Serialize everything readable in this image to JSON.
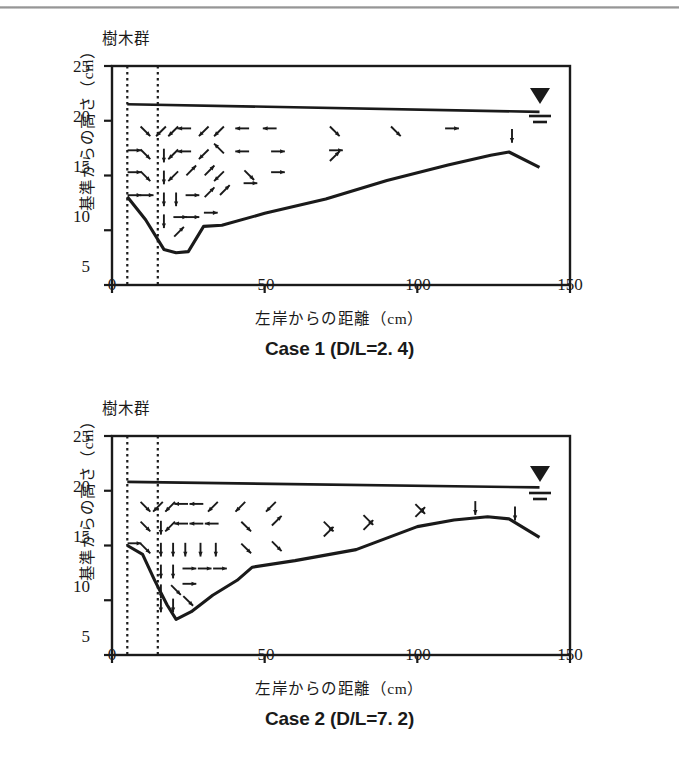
{
  "page": {
    "top_rule": "scan-edge-rule"
  },
  "axes": {
    "y_label": "基準からの高さ（cm）",
    "x_label": "左岸からの距離（cm）",
    "y_ticks": [
      25,
      20,
      15,
      10,
      5
    ],
    "x_ticks": [
      0,
      50,
      100,
      150
    ],
    "y_range": [
      5,
      25
    ],
    "x_range": [
      0,
      150
    ],
    "y_unit": "cm",
    "x_unit": "cm"
  },
  "annotations": {
    "vegetation_label": "樹木群",
    "vegetation_band_cm": [
      5,
      15
    ],
    "water_surface_symbol": "inverted-triangle-with-hatch"
  },
  "chart_data": [
    {
      "type": "line",
      "title": "Case 1（D/L=2.4）",
      "caption": "Case 1 (D/L=2. 4)",
      "xlabel": "左岸からの距離（cm）",
      "ylabel": "基準からの高さ（cm）",
      "xlim": [
        0,
        150
      ],
      "ylim": [
        5,
        25
      ],
      "grid": false,
      "legend": "none",
      "series": [
        {
          "name": "水面 (water surface)",
          "x": [
            5,
            140
          ],
          "values": [
            21.6,
            20.9
          ]
        },
        {
          "name": "河床 (bed profile)",
          "x": [
            5,
            11,
            17,
            21,
            25,
            30,
            36,
            50,
            70,
            90,
            110,
            124,
            130,
            140
          ],
          "values": [
            13.1,
            11.0,
            8.3,
            8.0,
            8.1,
            10.4,
            10.5,
            11.6,
            12.9,
            14.6,
            16.0,
            16.9,
            17.2,
            15.8
          ]
        }
      ],
      "water_surface_marker_x": 137,
      "water_surface_marker_y": 21.0,
      "vectors": [
        {
          "x": 6,
          "y": 17.3,
          "dir": "right"
        },
        {
          "x": 6,
          "y": 15.3,
          "dir": "right"
        },
        {
          "x": 6,
          "y": 13.2,
          "dir": "right"
        },
        {
          "x": 10,
          "y": 19.3,
          "dir": "down-right"
        },
        {
          "x": 10,
          "y": 17.2,
          "dir": "down-right"
        },
        {
          "x": 10,
          "y": 15.2,
          "dir": "down-right"
        },
        {
          "x": 10,
          "y": 13.2,
          "dir": "right"
        },
        {
          "x": 17,
          "y": 19.3,
          "dir": "down-left"
        },
        {
          "x": 17,
          "y": 17.2,
          "dir": "down"
        },
        {
          "x": 17,
          "y": 15.2,
          "dir": "down"
        },
        {
          "x": 17,
          "y": 13.2,
          "dir": "down"
        },
        {
          "x": 17,
          "y": 11.2,
          "dir": "down"
        },
        {
          "x": 21,
          "y": 19.3,
          "dir": "down-left"
        },
        {
          "x": 21,
          "y": 17.2,
          "dir": "down-left"
        },
        {
          "x": 21,
          "y": 15.2,
          "dir": "down-left"
        },
        {
          "x": 21,
          "y": 13.2,
          "dir": "down"
        },
        {
          "x": 21,
          "y": 11.2,
          "dir": "right"
        },
        {
          "x": 21,
          "y": 9.6,
          "dir": "up-right"
        },
        {
          "x": 25,
          "y": 19.3,
          "dir": "left"
        },
        {
          "x": 25,
          "y": 17.2,
          "dir": "left"
        },
        {
          "x": 25,
          "y": 15.2,
          "dir": "up-right"
        },
        {
          "x": 25,
          "y": 13.2,
          "dir": "right"
        },
        {
          "x": 25,
          "y": 11.2,
          "dir": "right"
        },
        {
          "x": 31,
          "y": 19.3,
          "dir": "down-left"
        },
        {
          "x": 31,
          "y": 17.2,
          "dir": "down-left"
        },
        {
          "x": 31,
          "y": 15.2,
          "dir": "up-right"
        },
        {
          "x": 31,
          "y": 13.2,
          "dir": "up-right"
        },
        {
          "x": 31,
          "y": 11.6,
          "dir": "right"
        },
        {
          "x": 36,
          "y": 19.3,
          "dir": "down-left"
        },
        {
          "x": 36,
          "y": 17.2,
          "dir": "up-left"
        },
        {
          "x": 36,
          "y": 15.2,
          "dir": "down-left"
        },
        {
          "x": 36,
          "y": 13.4,
          "dir": "up-right"
        },
        {
          "x": 44,
          "y": 19.3,
          "dir": "left"
        },
        {
          "x": 44,
          "y": 17.2,
          "dir": "left"
        },
        {
          "x": 44,
          "y": 15.3,
          "dir": "down-right"
        },
        {
          "x": 44,
          "y": 14.3,
          "dir": "right"
        },
        {
          "x": 53,
          "y": 19.3,
          "dir": "left"
        },
        {
          "x": 53,
          "y": 17.2,
          "dir": "right"
        },
        {
          "x": 53,
          "y": 15.3,
          "dir": "right"
        },
        {
          "x": 72,
          "y": 19.3,
          "dir": "down-right"
        },
        {
          "x": 72,
          "y": 17.3,
          "dir": "right"
        },
        {
          "x": 72,
          "y": 16.5,
          "dir": "up-right"
        },
        {
          "x": 92,
          "y": 19.3,
          "dir": "down-right"
        },
        {
          "x": 110,
          "y": 19.3,
          "dir": "right"
        },
        {
          "x": 131,
          "y": 19.0,
          "dir": "down"
        }
      ]
    },
    {
      "type": "line",
      "title": "Case 2（D/L=7.2）",
      "caption": "Case 2 (D/L=7. 2)",
      "xlabel": "左岸からの距離（cm）",
      "ylabel": "基準からの高さ（cm）",
      "xlim": [
        0,
        150
      ],
      "ylim": [
        5,
        25
      ],
      "grid": false,
      "legend": "none",
      "series": [
        {
          "name": "水面 (water surface)",
          "x": [
            5,
            140
          ],
          "values": [
            20.9,
            20.4
          ]
        },
        {
          "name": "河床 (bed profile)",
          "x": [
            5,
            10,
            14,
            18,
            21,
            26,
            33,
            41,
            46,
            60,
            80,
            100,
            112,
            123,
            130,
            140
          ],
          "values": [
            15.0,
            14.2,
            11.8,
            9.6,
            8.3,
            9.0,
            10.5,
            11.9,
            13.1,
            13.7,
            14.7,
            16.8,
            17.4,
            17.7,
            17.5,
            15.8
          ]
        }
      ],
      "water_surface_marker_x": 137,
      "water_surface_marker_y": 20.5,
      "vectors": [
        {
          "x": 6,
          "y": 15.2,
          "dir": "right"
        },
        {
          "x": 10,
          "y": 18.8,
          "dir": "down-right"
        },
        {
          "x": 10,
          "y": 17.0,
          "dir": "down-right"
        },
        {
          "x": 10,
          "y": 15.0,
          "dir": "down-right"
        },
        {
          "x": 16,
          "y": 18.8,
          "dir": "down-left"
        },
        {
          "x": 16,
          "y": 17.0,
          "dir": "down"
        },
        {
          "x": 16,
          "y": 15.0,
          "dir": "down"
        },
        {
          "x": 16,
          "y": 13.0,
          "dir": "down"
        },
        {
          "x": 16,
          "y": 11.2,
          "dir": "down"
        },
        {
          "x": 16,
          "y": 9.9,
          "dir": "down"
        },
        {
          "x": 20,
          "y": 18.8,
          "dir": "down-left"
        },
        {
          "x": 20,
          "y": 17.0,
          "dir": "down-left"
        },
        {
          "x": 20,
          "y": 15.0,
          "dir": "down"
        },
        {
          "x": 20,
          "y": 13.0,
          "dir": "down"
        },
        {
          "x": 20,
          "y": 11.2,
          "dir": "down-right"
        },
        {
          "x": 20,
          "y": 9.9,
          "dir": "down"
        },
        {
          "x": 24,
          "y": 18.8,
          "dir": "left"
        },
        {
          "x": 24,
          "y": 17.0,
          "dir": "left"
        },
        {
          "x": 24,
          "y": 15.0,
          "dir": "down"
        },
        {
          "x": 24,
          "y": 12.9,
          "dir": "right"
        },
        {
          "x": 24,
          "y": 11.5,
          "dir": "right"
        },
        {
          "x": 24,
          "y": 10.2,
          "dir": "down-right"
        },
        {
          "x": 29,
          "y": 18.8,
          "dir": "left"
        },
        {
          "x": 29,
          "y": 17.0,
          "dir": "left"
        },
        {
          "x": 29,
          "y": 15.0,
          "dir": "down"
        },
        {
          "x": 29,
          "y": 12.9,
          "dir": "right"
        },
        {
          "x": 34,
          "y": 18.8,
          "dir": "down-left"
        },
        {
          "x": 34,
          "y": 17.0,
          "dir": "left"
        },
        {
          "x": 34,
          "y": 15.0,
          "dir": "down"
        },
        {
          "x": 34,
          "y": 12.9,
          "dir": "right"
        },
        {
          "x": 43,
          "y": 18.8,
          "dir": "down-left"
        },
        {
          "x": 43,
          "y": 17.0,
          "dir": "down-right"
        },
        {
          "x": 43,
          "y": 15.0,
          "dir": "down-right"
        },
        {
          "x": 53,
          "y": 18.8,
          "dir": "down-left"
        },
        {
          "x": 53,
          "y": 17.0,
          "dir": "up-right"
        },
        {
          "x": 53,
          "y": 15.2,
          "dir": "down-right"
        },
        {
          "x": 70,
          "y": 17.0,
          "dir": "down-right"
        },
        {
          "x": 70,
          "y": 16.0,
          "dir": "up-right"
        },
        {
          "x": 83,
          "y": 17.6,
          "dir": "down-right"
        },
        {
          "x": 83,
          "y": 16.6,
          "dir": "up-right"
        },
        {
          "x": 100,
          "y": 18.6,
          "dir": "down-right"
        },
        {
          "x": 100,
          "y": 17.8,
          "dir": "up-right"
        },
        {
          "x": 119,
          "y": 18.8,
          "dir": "down"
        },
        {
          "x": 132,
          "y": 18.3,
          "dir": "down"
        }
      ]
    }
  ]
}
